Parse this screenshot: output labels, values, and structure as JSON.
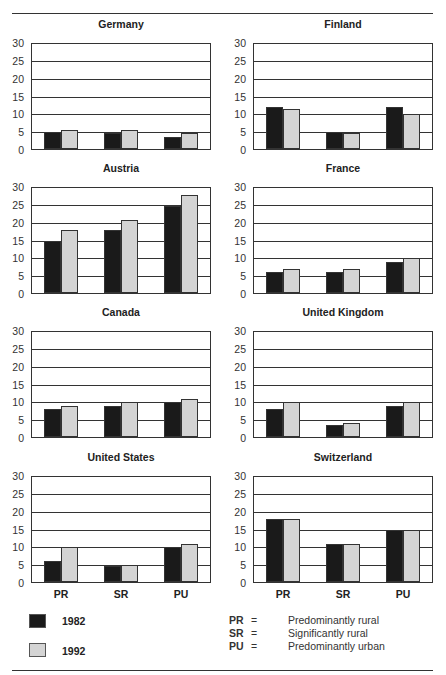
{
  "chart_data": {
    "type": "bar",
    "layout": "small-multiples grid 2 columns x 4 rows",
    "categories": [
      "PR",
      "SR",
      "PU"
    ],
    "series_names": [
      "1982",
      "1992"
    ],
    "series_colors": {
      "1982": "#1a1a1a",
      "1992": "#d4d4d4"
    },
    "ylim": [
      0,
      30
    ],
    "yticks": [
      0,
      5,
      10,
      15,
      20,
      25,
      30
    ],
    "grid": true,
    "panels": [
      {
        "title": "Germany",
        "series": [
          {
            "name": "1982",
            "values": [
              5,
              4.5,
              3.5
            ]
          },
          {
            "name": "1992",
            "values": [
              5.5,
              5.5,
              4.5
            ]
          }
        ]
      },
      {
        "title": "Finland",
        "series": [
          {
            "name": "1982",
            "values": [
              12,
              5,
              12
            ]
          },
          {
            "name": "1992",
            "values": [
              11.5,
              4.5,
              10
            ]
          }
        ]
      },
      {
        "title": "Austria",
        "series": [
          {
            "name": "1982",
            "values": [
              15,
              18,
              25
            ]
          },
          {
            "name": "1992",
            "values": [
              18,
              21,
              28
            ]
          }
        ]
      },
      {
        "title": "France",
        "series": [
          {
            "name": "1982",
            "values": [
              6,
              6,
              9
            ]
          },
          {
            "name": "1992",
            "values": [
              7,
              7,
              10
            ]
          }
        ]
      },
      {
        "title": "Canada",
        "series": [
          {
            "name": "1982",
            "values": [
              8,
              9,
              10
            ]
          },
          {
            "name": "1992",
            "values": [
              9,
              10,
              11
            ]
          }
        ]
      },
      {
        "title": "United Kingdom",
        "series": [
          {
            "name": "1982",
            "values": [
              8,
              3.5,
              9
            ]
          },
          {
            "name": "1992",
            "values": [
              10,
              4,
              10
            ]
          }
        ]
      },
      {
        "title": "United States",
        "series": [
          {
            "name": "1982",
            "values": [
              6,
              4.5,
              10
            ]
          },
          {
            "name": "1992",
            "values": [
              10,
              5,
              11
            ]
          }
        ]
      },
      {
        "title": "Switzerland",
        "series": [
          {
            "name": "1982",
            "values": [
              18,
              11,
              15
            ]
          },
          {
            "name": "1992",
            "values": [
              18,
              11,
              15
            ]
          }
        ]
      }
    ]
  },
  "legend": {
    "series": [
      {
        "label": "1982",
        "color": "#1a1a1a"
      },
      {
        "label": "1992",
        "color": "#d4d4d4"
      }
    ],
    "abbreviations": [
      {
        "abbr": "PR",
        "eq": "=",
        "desc": "Predominantly rural"
      },
      {
        "abbr": "SR",
        "eq": "=",
        "desc": "Significantly rural"
      },
      {
        "abbr": "PU",
        "eq": "=",
        "desc": "Predominantly urban"
      }
    ]
  }
}
